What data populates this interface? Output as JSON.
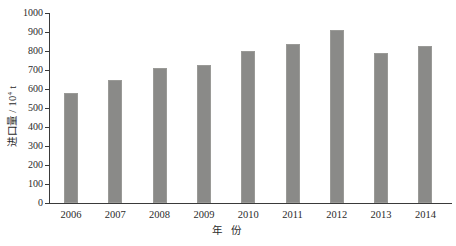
{
  "chart_data": {
    "type": "bar",
    "title": "",
    "subtitle": "",
    "xlabel": "年 份",
    "ylabel": "进口量 / 10⁴ t",
    "ylabel_parts": {
      "prefix": "进口量 / 10",
      "exponent": "4",
      "suffix": " t"
    },
    "categories": [
      "2006",
      "2007",
      "2008",
      "2009",
      "2010",
      "2011",
      "2012",
      "2013",
      "2014"
    ],
    "values": [
      580,
      645,
      710,
      727,
      800,
      837,
      912,
      792,
      828
    ],
    "series": [
      {
        "name": "进口量",
        "values": [
          580,
          645,
          710,
          727,
          800,
          837,
          912,
          792,
          828
        ]
      }
    ],
    "ylim": [
      0,
      1000
    ],
    "ytick_step": 100,
    "yticks": [
      "1000",
      "900",
      "800",
      "700",
      "600",
      "500",
      "400",
      "300",
      "200",
      "100",
      "0"
    ],
    "ytick_values": [
      1000,
      900,
      800,
      700,
      600,
      500,
      400,
      300,
      200,
      100,
      0
    ],
    "grid": false,
    "legend": false,
    "legend_position": "none",
    "bar_color": "#8a8a88",
    "axis_color": "#3a3a3a",
    "background": "#ffffff"
  }
}
